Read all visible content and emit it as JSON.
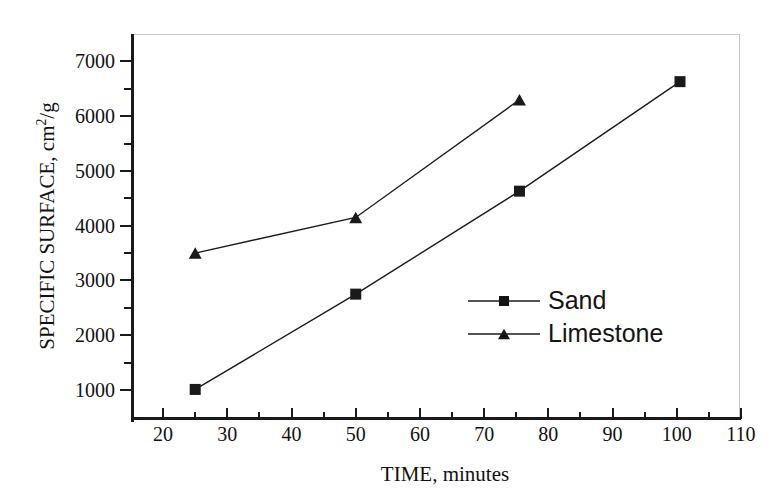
{
  "chart_data": {
    "type": "line",
    "title": "",
    "xlabel": "TIME, minutes",
    "ylabel": "SPECIFIC SURFACE, cm2/g",
    "ylabel_parts": {
      "prefix": "SPECIFIC SURFACE, cm",
      "exponent": "2",
      "suffix": "/g"
    },
    "xlim": [
      15,
      110
    ],
    "ylim": [
      470,
      7500
    ],
    "x_ticks": [
      20,
      30,
      40,
      50,
      60,
      70,
      80,
      90,
      100,
      110
    ],
    "x_tick_labels": [
      "20",
      "30",
      "40",
      "50",
      "60",
      "70",
      "80",
      "90",
      "100",
      "110"
    ],
    "x_minor_ticks": [
      25,
      35,
      45,
      55,
      65,
      75,
      85,
      95,
      105
    ],
    "y_ticks": [
      1000,
      2000,
      3000,
      4000,
      5000,
      6000,
      7000
    ],
    "y_tick_labels": [
      "1000",
      "2000",
      "3000",
      "4000",
      "5000",
      "6000",
      "7000"
    ],
    "y_minor_ticks": [
      1500,
      2500,
      3500,
      4500,
      5500,
      6500
    ],
    "grid": false,
    "legend_position": "center-right",
    "series": [
      {
        "name": "Sand",
        "marker": "square",
        "color": "#1a1a1a",
        "x": [
          25,
          50,
          75.5,
          100.5
        ],
        "values": [
          1010,
          2750,
          4630,
          6630
        ]
      },
      {
        "name": "Limestone",
        "marker": "triangle",
        "color": "#1a1a1a",
        "x": [
          25,
          50,
          75.5
        ],
        "values": [
          3500,
          4150,
          6300
        ]
      }
    ]
  },
  "legend": {
    "items": [
      {
        "label": "Sand",
        "marker": "square"
      },
      {
        "label": "Limestone",
        "marker": "triangle"
      }
    ]
  }
}
